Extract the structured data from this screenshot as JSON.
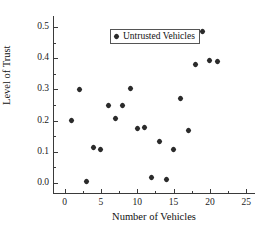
{
  "chart_data": {
    "type": "scatter",
    "title": "",
    "xlabel": "Number of Vehicles",
    "ylabel": "Level of Trust",
    "xlim": [
      -1.6,
      26.2
    ],
    "ylim": [
      -0.035,
      0.535
    ],
    "xticks": [
      0,
      5,
      10,
      15,
      20,
      25
    ],
    "xticklabels": [
      "0",
      "5",
      "10",
      "15",
      "20",
      "25"
    ],
    "yticks": [
      0.0,
      0.1,
      0.2,
      0.3,
      0.4,
      0.5
    ],
    "yticklabels": [
      "0.0",
      "0.1",
      "0.2",
      "0.3",
      "0.4",
      "0.5"
    ],
    "grid": false,
    "legend_position": "upper left",
    "series": [
      {
        "name": "Untrusted Vehicles",
        "marker": "diamond",
        "color": "#2b2b2b",
        "points": [
          {
            "x": 1,
            "y": 0.2
          },
          {
            "x": 2,
            "y": 0.301
          },
          {
            "x": 3,
            "y": 0.005
          },
          {
            "x": 4,
            "y": 0.115
          },
          {
            "x": 5,
            "y": 0.108
          },
          {
            "x": 6,
            "y": 0.249
          },
          {
            "x": 7,
            "y": 0.208
          },
          {
            "x": 8,
            "y": 0.25
          },
          {
            "x": 9,
            "y": 0.302
          },
          {
            "x": 10,
            "y": 0.176
          },
          {
            "x": 11,
            "y": 0.179
          },
          {
            "x": 12,
            "y": 0.018
          },
          {
            "x": 13,
            "y": 0.134
          },
          {
            "x": 14,
            "y": 0.011
          },
          {
            "x": 15,
            "y": 0.108
          },
          {
            "x": 16,
            "y": 0.272
          },
          {
            "x": 17,
            "y": 0.168
          },
          {
            "x": 18,
            "y": 0.381
          },
          {
            "x": 19,
            "y": 0.484
          },
          {
            "x": 20,
            "y": 0.392
          },
          {
            "x": 21,
            "y": 0.388
          }
        ]
      }
    ]
  },
  "legend": {
    "entries": [
      {
        "label": "Untrusted Vehicles",
        "marker": "diamond-marker"
      }
    ]
  }
}
